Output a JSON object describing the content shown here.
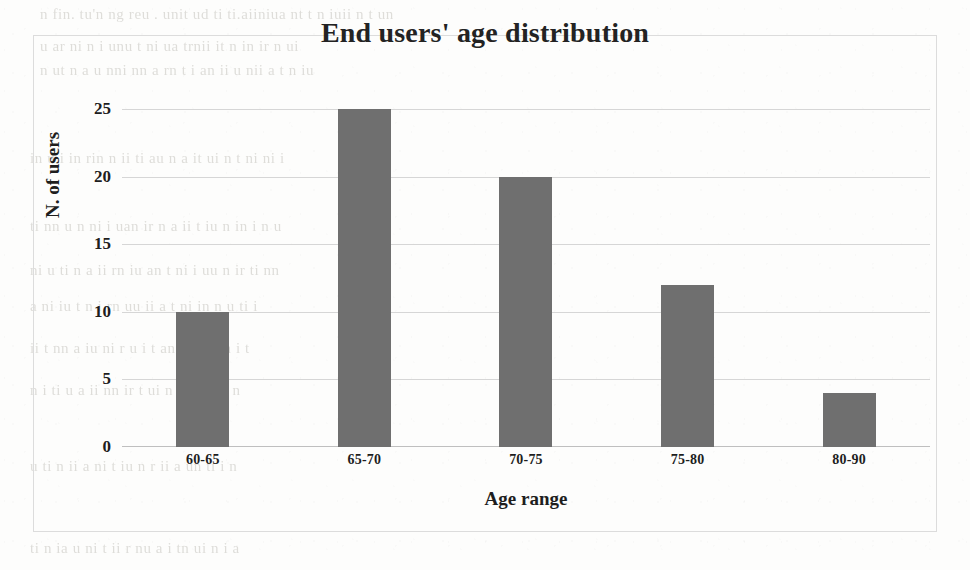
{
  "chart_data": {
    "type": "bar",
    "title": "End users' age distribution",
    "xlabel": "Age range",
    "ylabel": "N. of users",
    "categories": [
      "60-65",
      "65-70",
      "70-75",
      "75-80",
      "80-90"
    ],
    "values": [
      10,
      25,
      20,
      12,
      4
    ],
    "ylim": [
      0,
      25
    ],
    "ytick_labels": [
      "0",
      "5",
      "10",
      "15",
      "20",
      "25"
    ],
    "ytick_values": [
      0,
      5,
      10,
      15,
      20,
      25
    ],
    "grid": true,
    "legend": false,
    "legend_position": "none",
    "series": [
      {
        "name": "N. of users",
        "values": [
          10,
          25,
          20,
          12,
          4
        ],
        "color": "#6f6f6f"
      }
    ]
  },
  "figure": {
    "bar_color": "#6f6f6f",
    "grid_color": "#cfcfcf",
    "frame_color": "#dcdcdc",
    "text_color": "#1e1e1e",
    "background_color": "#fdfdfc"
  },
  "page_background": {
    "description": "faint scanned bleed-through text from reverse page",
    "ghost_lines": [
      {
        "text": "n fin. tu'n  ng reu . unit  ud  ti ti.aiiniua  nt  t n iuii n  t  un",
        "x": 40,
        "y": 6
      },
      {
        "text": "u  ar   ni   n i   unu t ni  ua  trnii   it   n in    ir  n  ui",
        "x": 40,
        "y": 38
      },
      {
        "text": "n  ut n   a   u  nni nn  a  rn t  i an ii  u nii  a   t n  iu",
        "x": 40,
        "y": 62
      },
      {
        "text": "in u   i  in  rin n  ii  ti  au  n  a  it  ui n t  ni  ni  i",
        "x": 30,
        "y": 150
      },
      {
        "text": "ti  nn u  n  ni  i uan  ir  n  a  ii  t iu  n  in  i  n  u",
        "x": 30,
        "y": 218
      },
      {
        "text": "ni  u  ti  n a  ii  rn  iu  an  t  ni  i  uu  n  ir  ti  nn",
        "x": 30,
        "y": 262
      },
      {
        "text": "a  ni  iu  t  n  i  rn  uu  ii  a  t  ni  in  n  u  ti  i",
        "x": 30,
        "y": 298
      },
      {
        "text": "ii  t  nn  a  iu  ni  r  u  i  t  an  ni  ii  u  n  i  t",
        "x": 30,
        "y": 340
      },
      {
        "text": "n  i  ti  u  a  ii  nn  ir  t  ui  n  a  i  tu  ni  n",
        "x": 30,
        "y": 382
      },
      {
        "text": "u  ti  n  ii  a  ni  t  iu  n  r  ii  a  un  ti  i  n",
        "x": 30,
        "y": 458
      },
      {
        "text": "ti  n  ia  u  ni  t  ii  r  nu  a  i  tn  ui  n  i  a",
        "x": 30,
        "y": 540
      }
    ]
  }
}
